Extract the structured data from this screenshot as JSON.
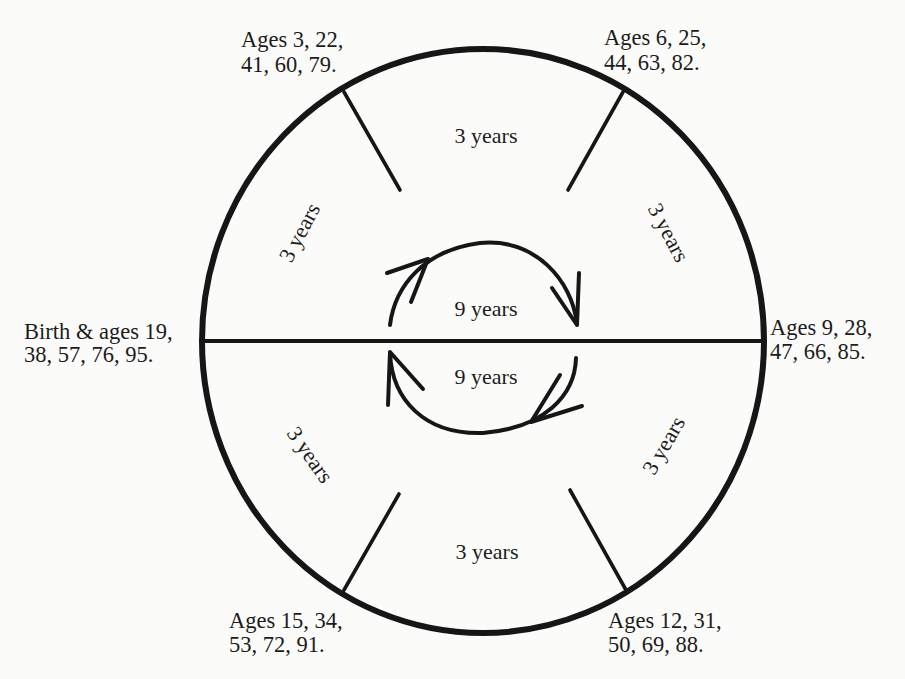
{
  "diagram": {
    "title": "",
    "cycle_total_years": 19,
    "nodes": {
      "left": {
        "line1": "Birth & ages 19,",
        "line2": "38, 57, 76, 95."
      },
      "top_left": {
        "line1": "Ages 3, 22,",
        "line2": "41, 60, 79."
      },
      "top_right": {
        "line1": "Ages 6, 25,",
        "line2": "44, 63, 82."
      },
      "right": {
        "line1": "Ages 9, 28,",
        "line2": "47, 66, 85."
      },
      "bottom_right": {
        "line1": "Ages 12, 31,",
        "line2": "50, 69, 88."
      },
      "bottom_left": {
        "line1": "Ages 15, 34,",
        "line2": "53, 72, 91."
      }
    },
    "segments": {
      "upper_left": "3 years",
      "top": "3 years",
      "upper_right": "3 years",
      "lower_right": "3 years",
      "bottom": "3 years",
      "lower_left": "3 years"
    },
    "inner_cycles": {
      "upper": {
        "label": "9 years",
        "direction": "clockwise"
      },
      "lower": {
        "label": "9 years",
        "direction": "clockwise"
      }
    },
    "colors": {
      "ink": "#161616",
      "paper": "#fbfbf9"
    }
  }
}
